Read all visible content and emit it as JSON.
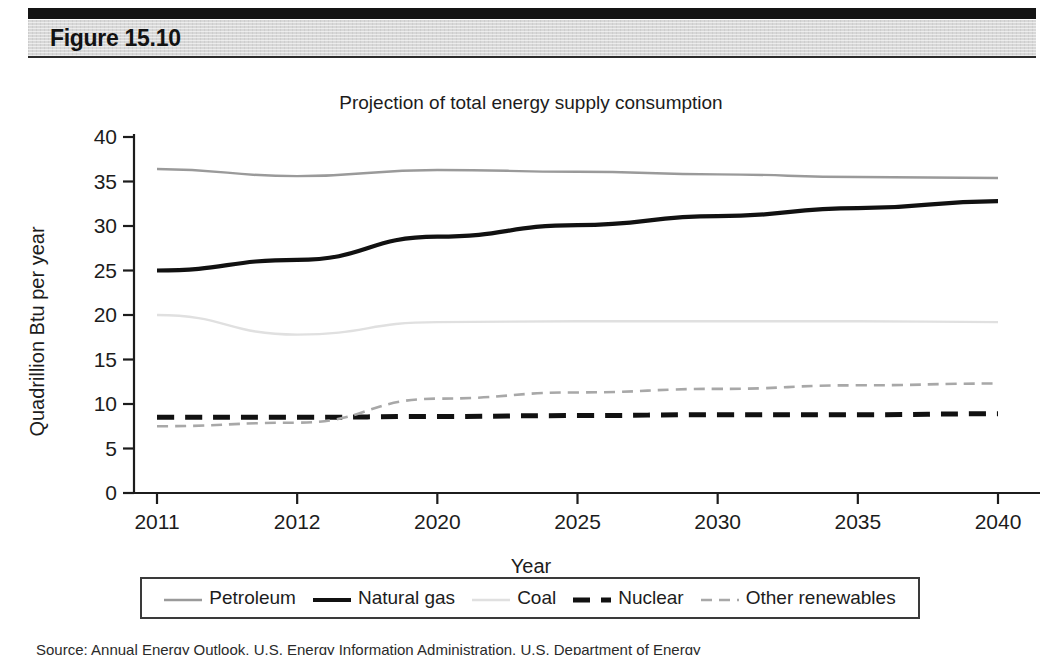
{
  "figure": {
    "label": "Figure 15.10",
    "caption": "Source: Annual Energy Outlook, U.S. Energy Information Administration, U.S. Department of Energy"
  },
  "chart_data": {
    "type": "line",
    "title": "Projection of total energy supply consumption",
    "xlabel": "Year",
    "ylabel": "Quadrillion Btu per year",
    "categories": [
      "2011",
      "2012",
      "2020",
      "2025",
      "2030",
      "2035",
      "2040"
    ],
    "ylim": [
      0,
      40
    ],
    "yticks": [
      0,
      5,
      10,
      15,
      20,
      25,
      30,
      35,
      40
    ],
    "grid": false,
    "legend_position": "below-plot",
    "series": [
      {
        "name": "Petroleum",
        "color": "#9a9a9a",
        "style": "solid-thin",
        "values": [
          36.4,
          35.6,
          36.3,
          36.1,
          35.8,
          35.5,
          35.4
        ]
      },
      {
        "name": "Natural gas",
        "color": "#111111",
        "style": "solid-thick",
        "values": [
          25.0,
          26.2,
          28.8,
          30.1,
          31.1,
          32.0,
          32.8
        ]
      },
      {
        "name": "Coal",
        "color": "#e0e0e0",
        "style": "solid-thin",
        "values": [
          20.0,
          17.8,
          19.2,
          19.3,
          19.3,
          19.3,
          19.2
        ]
      },
      {
        "name": "Nuclear",
        "color": "#111111",
        "style": "dashed-thick",
        "values": [
          8.5,
          8.5,
          8.6,
          8.7,
          8.8,
          8.8,
          8.9
        ]
      },
      {
        "name": "Other renewables",
        "color": "#a8a8a8",
        "style": "dashed-thin",
        "values": [
          7.5,
          7.9,
          10.6,
          11.3,
          11.7,
          12.1,
          12.3
        ]
      }
    ]
  }
}
